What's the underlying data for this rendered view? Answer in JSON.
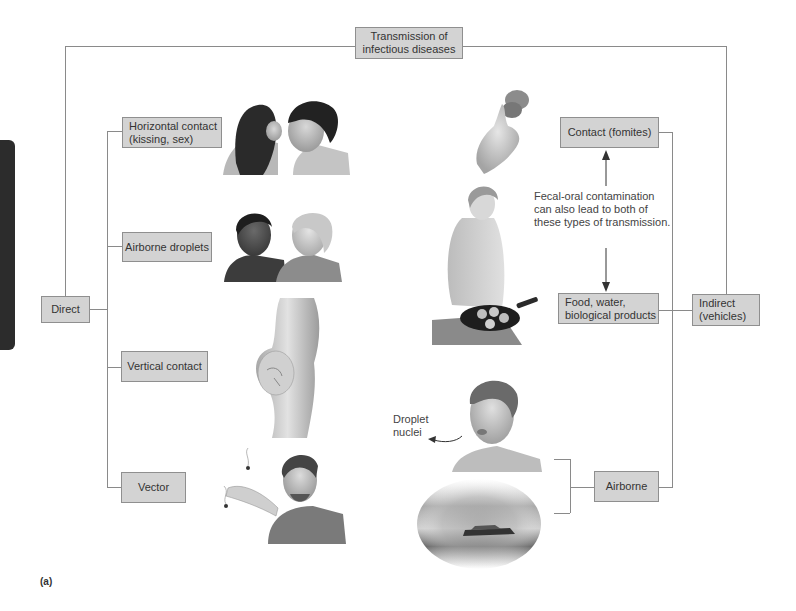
{
  "diagram": {
    "title": [
      "Transmission of",
      "infectious diseases"
    ],
    "figure_label": "(a)",
    "colors": {
      "box_fill": "#d3d3d3",
      "box_border": "#8f8f8f",
      "connector": "#8a8a8a",
      "side_tab": "#2c2c2c"
    },
    "direct": {
      "label": "Direct",
      "children": [
        {
          "lines": [
            "Horizontal contact",
            "(kissing, sex)"
          ],
          "illustration": "two-people-kissing"
        },
        {
          "lines": [
            "Airborne droplets"
          ],
          "illustration": "two-people-talking"
        },
        {
          "lines": [
            "Vertical contact"
          ],
          "illustration": "pregnant-woman"
        },
        {
          "lines": [
            "Vector"
          ],
          "illustration": "man-swatting-insects"
        }
      ]
    },
    "indirect": {
      "label": [
        "Indirect",
        "(vehicles)"
      ],
      "children": [
        {
          "lines": [
            "Contact (fomites)"
          ],
          "illustration": "hand-holding-object"
        },
        {
          "lines": [
            "Food, water,",
            "biological products"
          ],
          "illustration": "person-cooking"
        },
        {
          "lines": [
            "Airborne"
          ],
          "illustration": [
            "man-coughing",
            "car-dust-cloud"
          ]
        }
      ],
      "fecal_oral_note": [
        "Fecal-oral contamination",
        "can also lead to both of",
        "these types of transmission."
      ],
      "droplet_label": [
        "Droplet",
        "nuclei"
      ]
    }
  }
}
